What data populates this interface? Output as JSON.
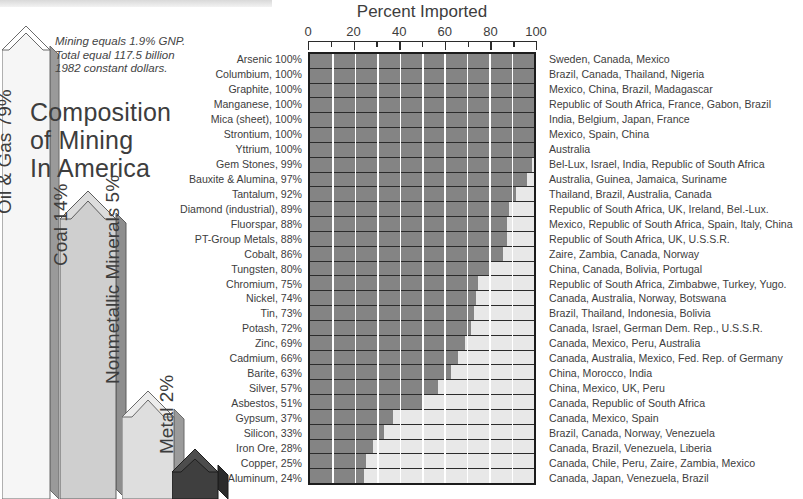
{
  "page": {
    "title": "Composition of Mining In America",
    "title_lines": [
      "Composition",
      "of Mining",
      "In America"
    ],
    "note": "Mining equals 1.9% GNP. Total equal 117.5 billion 1982 constant dollars.",
    "note_lines": [
      "Mining equals 1.9% GNP.",
      "Total equal 117.5 billion",
      "1982 constant dollars."
    ]
  },
  "composition": {
    "segments": [
      {
        "label": "Oil & Gas 79%",
        "name": "Oil & Gas",
        "percent": 79,
        "color": "#f4f4f4"
      },
      {
        "label": "Coal 14%",
        "name": "Coal",
        "percent": 14,
        "color": "#c9c9c9"
      },
      {
        "label": "Nonmetallic Minerals 5%",
        "name": "Nonmetallic Minerals",
        "percent": 5,
        "color": "#dcdcdc"
      },
      {
        "label": "Metal 2%",
        "name": "Metal",
        "percent": 2,
        "color": "#3d3d3d"
      }
    ]
  },
  "chart_data": {
    "type": "bar",
    "orientation": "horizontal",
    "title": "Percent Imported",
    "xlabel": "Percent Imported",
    "ylabel": "",
    "xlim": [
      0,
      100
    ],
    "xticks": [
      0,
      20,
      40,
      60,
      80,
      100
    ],
    "minor_tick_step": 10,
    "grid": true,
    "grid_color": "#ffffff",
    "bar_color": "#848484",
    "track_color": "#e8e8e8",
    "legend": "none",
    "categories": [
      "Arsenic",
      "Columbium",
      "Graphite",
      "Manganese",
      "Mica (sheet)",
      "Strontium",
      "Yttrium",
      "Gem Stones",
      "Bauxite & Alumina",
      "Tantalum",
      "Diamond (industrial)",
      "Fluorspar",
      "PT-Group Metals",
      "Cobalt",
      "Tungsten",
      "Chromium",
      "Nickel",
      "Tin",
      "Potash",
      "Zinc",
      "Cadmium",
      "Barite",
      "Silver",
      "Asbestos",
      "Gypsum",
      "Silicon",
      "Iron Ore",
      "Copper",
      "Aluminum"
    ],
    "values": [
      100,
      100,
      100,
      100,
      100,
      100,
      100,
      99,
      97,
      92,
      89,
      88,
      88,
      86,
      80,
      75,
      74,
      73,
      72,
      69,
      66,
      63,
      57,
      51,
      37,
      33,
      28,
      25,
      24
    ],
    "rows": [
      {
        "label": "Arsenic 100%",
        "value": 100,
        "sources": "Sweden, Canada, Mexico"
      },
      {
        "label": "Columbium, 100%",
        "value": 100,
        "sources": "Brazil, Canada, Thailand, Nigeria"
      },
      {
        "label": "Graphite, 100%",
        "value": 100,
        "sources": "Mexico, China, Brazil, Madagascar"
      },
      {
        "label": "Manganese, 100%",
        "value": 100,
        "sources": "Republic of South Africa, France, Gabon, Brazil"
      },
      {
        "label": "Mica (sheet), 100%",
        "value": 100,
        "sources": "India, Belgium, Japan, France"
      },
      {
        "label": "Strontium, 100%",
        "value": 100,
        "sources": "Mexico, Spain, China"
      },
      {
        "label": "Yttrium, 100%",
        "value": 100,
        "sources": "Australia"
      },
      {
        "label": "Gem Stones, 99%",
        "value": 99,
        "sources": "Bel-Lux, Israel, India, Republic of South Africa"
      },
      {
        "label": "Bauxite & Alumina, 97%",
        "value": 97,
        "sources": "Australia, Guinea, Jamaica, Suriname"
      },
      {
        "label": "Tantalum, 92%",
        "value": 92,
        "sources": "Thailand, Brazil, Australia, Canada"
      },
      {
        "label": "Diamond (industrial), 89%",
        "value": 89,
        "sources": "Republic of South Africa, UK, Ireland, Bel.-Lux."
      },
      {
        "label": "Fluorspar, 88%",
        "value": 88,
        "sources": "Mexico, Republic of South Africa, Spain, Italy, China"
      },
      {
        "label": "PT-Group Metals, 88%",
        "value": 88,
        "sources": "Republic of South Africa, UK, U.S.S.R."
      },
      {
        "label": "Cobalt, 86%",
        "value": 86,
        "sources": "Zaire, Zambia, Canada, Norway"
      },
      {
        "label": "Tungsten, 80%",
        "value": 80,
        "sources": "China, Canada, Bolivia, Portugal"
      },
      {
        "label": "Chromium, 75%",
        "value": 75,
        "sources": "Republic of South Africa, Zimbabwe, Turkey, Yugo."
      },
      {
        "label": "Nickel, 74%",
        "value": 74,
        "sources": "Canada, Australia, Norway, Botswana"
      },
      {
        "label": "Tin, 73%",
        "value": 73,
        "sources": "Brazil, Thailand, Indonesia, Bolivia"
      },
      {
        "label": "Potash, 72%",
        "value": 72,
        "sources": "Canada, Israel, German Dem. Rep., U.S.S.R."
      },
      {
        "label": "Zinc, 69%",
        "value": 69,
        "sources": "Canada, Mexico, Peru, Australia"
      },
      {
        "label": "Cadmium, 66%",
        "value": 66,
        "sources": "Canada, Australia, Mexico, Fed. Rep. of Germany"
      },
      {
        "label": "Barite, 63%",
        "value": 63,
        "sources": "China, Morocco, India"
      },
      {
        "label": "Silver, 57%",
        "value": 57,
        "sources": "China, Mexico, UK, Peru"
      },
      {
        "label": "Asbestos, 51%",
        "value": 51,
        "sources": "Canada, Republic of South Africa"
      },
      {
        "label": "Gypsum, 37%",
        "value": 37,
        "sources": "Canada, Mexico, Spain"
      },
      {
        "label": "Silicon, 33%",
        "value": 33,
        "sources": "Brazil, Canada, Norway, Venezuela"
      },
      {
        "label": "Iron Ore, 28%",
        "value": 28,
        "sources": "Canada, Brazil, Venezuela, Liberia"
      },
      {
        "label": "Copper, 25%",
        "value": 25,
        "sources": "Canada, Chile, Peru, Zaire, Zambia, Mexico"
      },
      {
        "label": "Aluminum, 24%",
        "value": 24,
        "sources": "Canada, Japan, Venezuela, Brazil"
      }
    ]
  }
}
